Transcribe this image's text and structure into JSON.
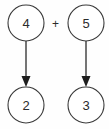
{
  "diagram": {
    "type": "arrow-mapping",
    "background_color": "#fefefe",
    "stroke_color": "#3a3a3a",
    "text_color": "#2b2b2b",
    "operator": {
      "symbol": "+",
      "name": "plus-operator"
    },
    "nodes": [
      {
        "id": "top-left",
        "label": "4",
        "cx": 26,
        "cy": 23,
        "r": 18,
        "row": "top",
        "column": "left"
      },
      {
        "id": "top-right",
        "label": "5",
        "cx": 86,
        "cy": 23,
        "r": 18,
        "row": "top",
        "column": "right"
      },
      {
        "id": "bottom-left",
        "label": "2",
        "cx": 26,
        "cy": 105,
        "r": 18,
        "row": "bottom",
        "column": "left"
      },
      {
        "id": "bottom-right",
        "label": "3",
        "cx": 86,
        "cy": 105,
        "r": 18,
        "row": "bottom",
        "column": "right"
      }
    ],
    "edges": [
      {
        "id": "edge-left",
        "from": "top-left",
        "to": "bottom-left",
        "direction": "down",
        "arrowhead": "solid-triangle"
      },
      {
        "id": "edge-right",
        "from": "top-right",
        "to": "bottom-right",
        "direction": "down",
        "arrowhead": "solid-triangle"
      }
    ]
  }
}
